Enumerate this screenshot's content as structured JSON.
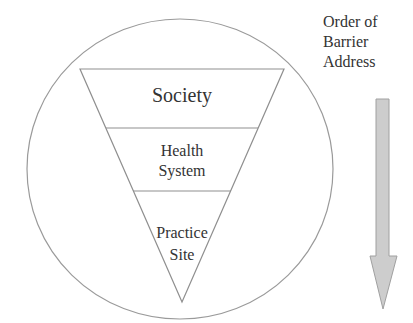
{
  "diagram": {
    "type": "inverted-triangle-in-circle",
    "levels": [
      {
        "id": "society",
        "lines": [
          "Society"
        ]
      },
      {
        "id": "health-system",
        "lines": [
          "Health",
          "System"
        ]
      },
      {
        "id": "practice-site",
        "lines": [
          "Practice",
          "Site"
        ]
      }
    ],
    "side_label": {
      "lines": [
        "Order of",
        "Barrier",
        "Address"
      ]
    },
    "arrow": {
      "direction": "down",
      "fill": "#cccccc",
      "stroke": "#999999"
    },
    "colors": {
      "outline": "#999999",
      "text": "#333333",
      "background": "#ffffff"
    }
  }
}
